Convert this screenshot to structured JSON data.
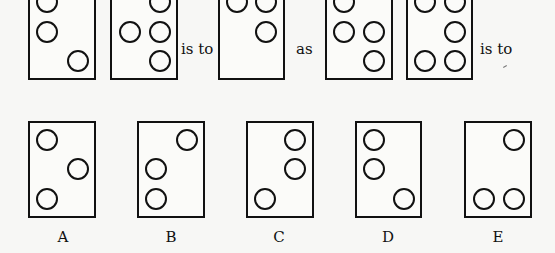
{
  "question": {
    "connectors": [
      "is to",
      "as",
      "is to"
    ]
  },
  "options": {
    "labels": [
      "A",
      "B",
      "C",
      "D",
      "E"
    ]
  }
}
